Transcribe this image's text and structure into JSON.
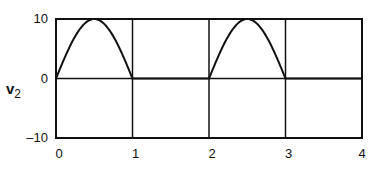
{
  "chart_data": {
    "type": "line",
    "title": "",
    "xlabel": "",
    "ylabel": "v2",
    "ylabel_main": "v",
    "ylabel_sub": "2",
    "xlim": [
      0,
      4
    ],
    "ylim": [
      -10,
      10
    ],
    "x_ticks": [
      "0",
      "1",
      "2",
      "3",
      "4"
    ],
    "y_ticks": [
      "10",
      "0",
      "-10"
    ],
    "grid": true,
    "legend": null,
    "series": [
      {
        "name": "v2",
        "description": "half-wave rectified sine, amplitude 10, period 2",
        "x": [
          0,
          0.1,
          0.2,
          0.3,
          0.4,
          0.5,
          0.6,
          0.7,
          0.8,
          0.9,
          1.0,
          1.5,
          2.0,
          2.1,
          2.2,
          2.3,
          2.4,
          2.5,
          2.6,
          2.7,
          2.8,
          2.9,
          3.0,
          3.5,
          4.0
        ],
        "values": [
          0,
          3.09,
          5.88,
          8.09,
          9.51,
          10,
          9.51,
          8.09,
          5.88,
          3.09,
          0,
          0,
          0,
          3.09,
          5.88,
          8.09,
          9.51,
          10,
          9.51,
          8.09,
          5.88,
          3.09,
          0,
          0,
          0
        ]
      }
    ]
  }
}
